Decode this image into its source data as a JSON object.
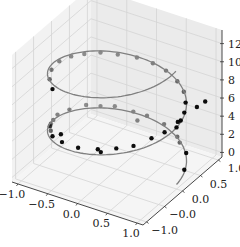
{
  "chart_data": {
    "type": "scatter",
    "subtype": "3d-line-and-scatter",
    "title": "",
    "xlabel": "",
    "ylabel": "",
    "zlabel": "",
    "grid": true,
    "legend": null,
    "xlim": [
      -1.1,
      1.1
    ],
    "ylim": [
      -1.1,
      1.1
    ],
    "zlim": [
      -0.5,
      13.5
    ],
    "x_ticks": [
      "−1.0",
      "−0.5",
      "0.0",
      "0.5",
      "1.0"
    ],
    "y_ticks": [
      "−1.0",
      "−0.0",
      "0.0",
      "0.5",
      "1.0"
    ],
    "z_ticks": [
      "0",
      "2",
      "4",
      "6",
      "8",
      "10",
      "12"
    ],
    "line": {
      "name": "helix",
      "color": "#808080",
      "description": "x = cos(t), y = sin(t), z = t, t from 0 to ~12.6 (two turns)",
      "t_start": 0,
      "t_end": 12.6
    },
    "scatter": {
      "name": "noisy helix samples",
      "color": "#000000",
      "depthshade": true,
      "points": [
        [
          0.95,
          0.3,
          0.5
        ],
        [
          0.8,
          0.6,
          1.0
        ],
        [
          0.5,
          0.85,
          1.3
        ],
        [
          0.2,
          0.98,
          1.6
        ],
        [
          -0.1,
          1.0,
          1.8
        ],
        [
          -0.3,
          0.95,
          2.0
        ],
        [
          -0.55,
          0.85,
          2.4
        ],
        [
          -0.7,
          0.7,
          2.6
        ],
        [
          -0.85,
          0.55,
          2.9
        ],
        [
          -0.95,
          0.25,
          3.2
        ],
        [
          -1.0,
          0.0,
          3.4
        ],
        [
          -0.95,
          -0.2,
          3.6
        ],
        [
          -0.85,
          -0.45,
          4.0
        ],
        [
          -0.75,
          -0.6,
          4.2
        ],
        [
          -0.8,
          -0.55,
          4.4
        ],
        [
          -0.6,
          -0.8,
          4.6
        ],
        [
          -0.35,
          -0.95,
          5.0
        ],
        [
          -0.05,
          -1.0,
          5.2
        ],
        [
          0.25,
          -0.95,
          5.5
        ],
        [
          0.5,
          -0.85,
          5.8
        ],
        [
          0.7,
          -0.7,
          6.0
        ],
        [
          0.85,
          -0.45,
          6.3
        ],
        [
          0.95,
          -0.25,
          6.5
        ],
        [
          1.0,
          0.0,
          6.3
        ],
        [
          0.98,
          0.15,
          6.5
        ],
        [
          0.95,
          0.3,
          6.8
        ],
        [
          0.85,
          0.5,
          7.0
        ],
        [
          0.7,
          0.7,
          7.2
        ],
        [
          0.5,
          0.85,
          7.4
        ],
        [
          0.25,
          0.95,
          7.7
        ],
        [
          0.0,
          1.0,
          7.8
        ],
        [
          -0.25,
          0.97,
          8.0
        ],
        [
          -0.5,
          0.85,
          8.2
        ],
        [
          -0.7,
          0.7,
          8.5
        ],
        [
          -0.85,
          0.5,
          8.7
        ],
        [
          -0.95,
          0.3,
          8.9
        ],
        [
          -1.0,
          0.05,
          9.1
        ],
        [
          -0.95,
          -0.25,
          9.3
        ],
        [
          -0.8,
          -0.55,
          9.6
        ],
        [
          -0.6,
          -0.8,
          9.8
        ],
        [
          1.1,
          0.4,
          7.4
        ],
        [
          1.15,
          0.55,
          7.6
        ],
        [
          0.9,
          0.2,
          6.0
        ],
        [
          0.3,
          -0.95,
          5.3
        ],
        [
          -0.4,
          -0.9,
          5.6
        ],
        [
          -0.9,
          -0.35,
          3.8
        ],
        [
          -0.2,
          0.9,
          1.4
        ],
        [
          0.6,
          0.75,
          1.2
        ]
      ]
    }
  }
}
